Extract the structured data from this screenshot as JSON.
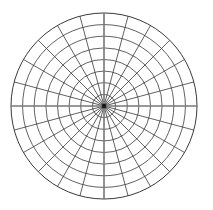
{
  "figure": {
    "name": "polar-grid",
    "background_color": "#ffffff",
    "width": 213,
    "height": 210
  },
  "chart_data": {
    "type": "polar-grid",
    "title": "",
    "subtitle": "",
    "xlabel": "",
    "ylabel": "",
    "grid": true,
    "legend": null,
    "annotations": [],
    "center": {
      "x": 104,
      "y": 106
    },
    "outer_radius": 93,
    "radial_axis": {
      "label": "",
      "range": [
        0,
        8
      ],
      "tick_values": [
        1,
        2,
        3,
        4,
        5,
        6,
        7,
        8
      ],
      "tick_labels": [],
      "ring_count": 8,
      "ring_radii_px": [
        11.6,
        23.3,
        34.9,
        46.5,
        58.1,
        69.8,
        81.4,
        93.0
      ]
    },
    "angular_axis": {
      "label": "",
      "range_deg": [
        0,
        360
      ],
      "spoke_count": 24,
      "spoke_step_deg": 15,
      "tick_values_deg": [
        0,
        15,
        30,
        45,
        60,
        75,
        90,
        105,
        120,
        135,
        150,
        165,
        180,
        195,
        210,
        225,
        240,
        255,
        270,
        285,
        300,
        315,
        330,
        345
      ],
      "tick_labels": []
    },
    "series": [],
    "values": [],
    "categories": []
  },
  "style": {
    "grid_line_color": "#3a3a3a",
    "grid_line_width": 0.8,
    "axis_line_color": "#777777",
    "axis_line_width": 1.6,
    "outer_circle_color": "#3a3a3a",
    "outer_circle_width": 1.0,
    "center_dot_color": "#1a1a1a",
    "center_dot_radius": 2.2
  }
}
